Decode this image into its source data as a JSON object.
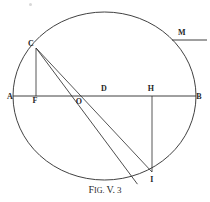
{
  "figure": {
    "caption_lead": "F",
    "caption_rest": "IG.",
    "caption_volume": "V.",
    "caption_number": "3",
    "stroke_color": "#2b2b2b",
    "background_color": "#ffffff"
  },
  "geometry": {
    "circle": {
      "cx": 104.5,
      "cy": 96,
      "r": 84
    },
    "points": [
      {
        "id": "A",
        "label": "A",
        "x": 13,
        "y": 96,
        "label_x": 10,
        "label_y": 97
      },
      {
        "id": "F",
        "label": "F",
        "x": 36,
        "y": 96,
        "label_x": 35,
        "label_y": 101
      },
      {
        "id": "O",
        "label": "O",
        "x": 80,
        "y": 96,
        "label_x": 79,
        "label_y": 102
      },
      {
        "id": "D",
        "label": "D",
        "x": 105,
        "y": 96,
        "label_x": 104,
        "label_y": 89
      },
      {
        "id": "H",
        "label": "H",
        "x": 152,
        "y": 96,
        "label_x": 151,
        "label_y": 89
      },
      {
        "id": "B",
        "label": "B",
        "x": 196,
        "y": 96,
        "label_x": 198,
        "label_y": 97
      },
      {
        "id": "C",
        "label": "C",
        "x": 36,
        "y": 48,
        "label_x": 31,
        "label_y": 44
      },
      {
        "id": "I",
        "label": "I",
        "x": 152,
        "y": 172,
        "label_x": 152,
        "label_y": 179
      }
    ],
    "segments": [
      {
        "name": "diameter-AB",
        "from": "A",
        "to": "B"
      },
      {
        "name": "chord-CF",
        "from": "C",
        "to": "F"
      },
      {
        "name": "chord-CD-to-I",
        "from": "C",
        "to": "I"
      },
      {
        "name": "chord-C-to-I-via-O",
        "from": "C",
        "to": "I"
      },
      {
        "name": "chord-HI",
        "from": "H",
        "to": "I"
      }
    ],
    "marker": {
      "label": "M",
      "label_x": 182,
      "label_y": 33,
      "rule_x1": 172,
      "rule_x2": 207,
      "rule_y": 40
    }
  }
}
